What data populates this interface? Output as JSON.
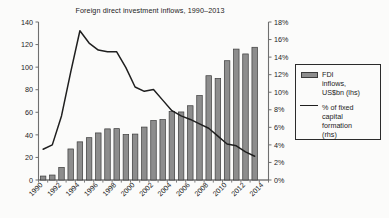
{
  "chart_data": {
    "type": "bar",
    "title": "Foreign direct investment inflows, 1990–2013",
    "xlabel": "",
    "ylabel": "",
    "grid": false,
    "legend_position": "right",
    "categories": [
      1990,
      1991,
      1992,
      1993,
      1994,
      1995,
      1996,
      1997,
      1998,
      1999,
      2000,
      2001,
      2002,
      2003,
      2004,
      2005,
      2006,
      2007,
      2008,
      2009,
      2010,
      2011,
      2012,
      2013
    ],
    "x_tick_labels": [
      "1990",
      "1992",
      "1994",
      "1996",
      "1998",
      "2000",
      "2002",
      "2004",
      "2006",
      "2008",
      "2010",
      "2012",
      "2014"
    ],
    "series": [
      {
        "name": "FDI inflows, US$bn (lhs)",
        "type": "bar",
        "axis": "left",
        "color": "#8d8d8d",
        "edge_color": "#3b3b3b",
        "values": [
          3.5,
          4.4,
          11.2,
          27.5,
          33.8,
          37.5,
          41.7,
          45.3,
          45.5,
          40.3,
          40.7,
          46.9,
          52.7,
          53.5,
          60.6,
          60.3,
          65.8,
          74.8,
          92.4,
          90.0,
          105.7,
          116.0,
          111.7,
          117.6
        ]
      },
      {
        "name": "% of fixed capital formation (rhs)",
        "type": "line",
        "axis": "right",
        "color": "#1f1f1f",
        "values": [
          3.5,
          4.0,
          7.3,
          12.3,
          17.0,
          15.6,
          14.8,
          14.6,
          14.6,
          12.8,
          10.6,
          10.1,
          10.3,
          9.1,
          7.9,
          7.3,
          6.9,
          6.4,
          5.9,
          5.0,
          4.1,
          3.9,
          3.2,
          2.7
        ]
      }
    ],
    "left_axis": {
      "min": 0,
      "max": 140,
      "step": 20,
      "tick_labels": [
        "0",
        "20",
        "40",
        "60",
        "80",
        "100",
        "120",
        "140"
      ]
    },
    "right_axis": {
      "min": 0,
      "max": 18,
      "step": 2,
      "unit": "%",
      "tick_labels": [
        "0%",
        "2%",
        "4%",
        "6%",
        "8%",
        "10%",
        "12%",
        "14%",
        "16%",
        "18%"
      ]
    }
  },
  "legend": {
    "entries": [
      {
        "marker": "bar-swatch",
        "label": "FDI\ninflows,\nUS$bn (lhs)"
      },
      {
        "marker": "line-swatch",
        "label": "% of fixed\ncapital\nformation\n(rhs)"
      }
    ]
  }
}
